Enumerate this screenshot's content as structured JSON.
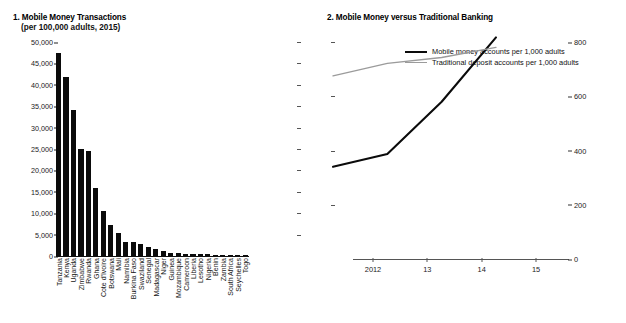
{
  "chart_data": [
    {
      "type": "bar",
      "panel_number": "1.",
      "title": "1. Mobile Money Transactions",
      "subtitle": "(per 100,000 adults, 2015)",
      "xlabel": "",
      "ylabel": "",
      "ylim": [
        0,
        50000
      ],
      "yticks": [
        "0",
        "5,000",
        "10,000",
        "15,000",
        "20,000",
        "25,000",
        "30,000",
        "35,000",
        "40,000",
        "45,000",
        "50,000"
      ],
      "ytick_values": [
        0,
        5000,
        10000,
        15000,
        20000,
        25000,
        30000,
        35000,
        40000,
        45000,
        50000
      ],
      "grid": false,
      "legend": "none",
      "bar_color": "#0b0b0b",
      "categories": [
        "Tanzania",
        "Kenya",
        "Uganda",
        "Zimbabwe",
        "Rwanda",
        "Ghana",
        "Cote d'Ivoire",
        "Botswana",
        "Mali",
        "Namibia",
        "Burkina Faso",
        "Swaziland",
        "Senegal",
        "Madagascar",
        "Niger",
        "Guinea",
        "Mozambique",
        "Cameroon",
        "Liberia",
        "Lesotho",
        "Nigeria",
        "Benin",
        "Zambia",
        "South Africa",
        "Seychelles",
        "Togo"
      ],
      "values": [
        47500,
        41800,
        34200,
        25000,
        24600,
        15800,
        10600,
        7300,
        5400,
        3300,
        3250,
        2800,
        2000,
        1700,
        1100,
        700,
        620,
        560,
        520,
        430,
        380,
        330,
        300,
        260,
        220,
        180
      ]
    },
    {
      "type": "line",
      "panel_number": "2.",
      "title": "2. Mobile Money versus Traditional Banking",
      "subtitle": "",
      "xlabel": "",
      "ylabel": "",
      "ylim": [
        0,
        800
      ],
      "yticks": [
        "0",
        "200",
        "400",
        "600",
        "800"
      ],
      "ytick_values": [
        0,
        200,
        400,
        600,
        800
      ],
      "grid": false,
      "legend_position": "top-center",
      "x": [
        "2012",
        "13",
        "14",
        "15"
      ],
      "series": [
        {
          "name": "Mobile money accounts per 1,000 adults",
          "color": "#0b0b0b",
          "width": 2.1,
          "values": [
            185,
            232,
            425,
            662
          ]
        },
        {
          "name": "Traditional deposit accounts per 1,000 adults",
          "color": "#9b9b9b",
          "width": 1.3,
          "values": [
            520,
            566,
            588,
            625
          ]
        }
      ]
    }
  ],
  "panel1": {
    "title": "1. Mobile Money Transactions",
    "subtitle": "(per 100,000 adults, 2015)"
  },
  "panel2": {
    "title": "2. Mobile Money versus Traditional Banking",
    "legend": [
      "Mobile money accounts per 1,000 adults",
      "Traditional deposit accounts per 1,000 adults"
    ]
  },
  "colors": {
    "background": "#ffffff",
    "text": "#111111",
    "bar": "#0b0b0b",
    "series_dark": "#0b0b0b",
    "series_light": "#9b9b9b",
    "axis": "#555555"
  }
}
